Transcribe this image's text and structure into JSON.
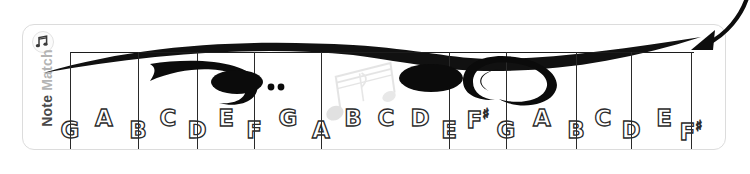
{
  "brand": {
    "name_bold": "Note",
    "name_light": "Match",
    "logo_icon": "music-badge-icon"
  },
  "staff": {
    "clefs": [
      "bass-clef",
      "treble-clef"
    ],
    "decorations": [
      "calligraphic-wave",
      "watermark-musical-notes"
    ],
    "grid_line_count": 10,
    "grid_line_positions": [
      47,
      115,
      174,
      231,
      298,
      426,
      483,
      553,
      608,
      668
    ]
  },
  "annotation": {
    "arrow_icon": "curved-arrow-down-left"
  },
  "notes": [
    {
      "label": "G",
      "sharp": "",
      "position": "line",
      "x": 47
    },
    {
      "label": "A",
      "sharp": "",
      "position": "space",
      "x": 81
    },
    {
      "label": "C",
      "sharp": "",
      "position": "space",
      "x": 145
    },
    {
      "label": "B",
      "sharp": "",
      "position": "line",
      "x": 115
    },
    {
      "label": "D",
      "sharp": "",
      "position": "line",
      "x": 174
    },
    {
      "label": "E",
      "sharp": "",
      "position": "space",
      "x": 203
    },
    {
      "label": "F",
      "sharp": "",
      "position": "line",
      "x": 231
    },
    {
      "label": "G",
      "sharp": "",
      "position": "space",
      "x": 265
    },
    {
      "label": "A",
      "sharp": "",
      "position": "line",
      "x": 298
    },
    {
      "label": "B",
      "sharp": "",
      "position": "space",
      "x": 330
    },
    {
      "label": "C",
      "sharp": "",
      "position": "space",
      "x": 363
    },
    {
      "label": "D",
      "sharp": "",
      "position": "space",
      "x": 397
    },
    {
      "label": "E",
      "sharp": "",
      "position": "line",
      "x": 426
    },
    {
      "label": "F",
      "sharp": "♯",
      "position": "space",
      "x": 455
    },
    {
      "label": "G",
      "sharp": "",
      "position": "line",
      "x": 483
    },
    {
      "label": "A",
      "sharp": "",
      "position": "space",
      "x": 519
    },
    {
      "label": "B",
      "sharp": "",
      "position": "line",
      "x": 553
    },
    {
      "label": "C",
      "sharp": "",
      "position": "space",
      "x": 580
    },
    {
      "label": "D",
      "sharp": "",
      "position": "line",
      "x": 608
    },
    {
      "label": "E",
      "sharp": "",
      "position": "space",
      "x": 641
    },
    {
      "label": "F",
      "sharp": "♯",
      "position": "line",
      "x": 668
    }
  ]
}
